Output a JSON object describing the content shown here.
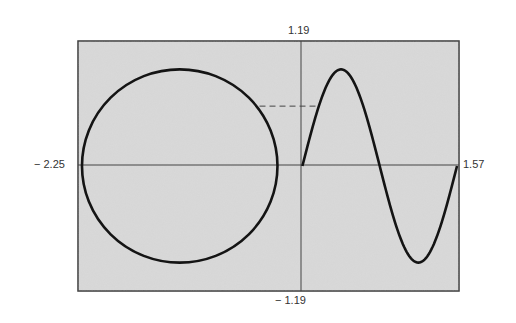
{
  "chart_data": {
    "type": "line",
    "title": "",
    "xlabel": "",
    "ylabel": "",
    "xlim": [
      -2.25,
      1.57
    ],
    "ylim": [
      -1.19,
      1.19
    ],
    "grid": false,
    "legend": null,
    "tick_labels": {
      "x_min": "− 2.25",
      "x_max": "1.57",
      "y_max": "1.19",
      "y_min": "− 1.19"
    },
    "series": [
      {
        "name": "circle",
        "kind": "parametric",
        "description": "closed circle centered left of origin",
        "center": [
          -1.23,
          0.0
        ],
        "radius": 0.98,
        "x_range": [
          -2.21,
          -0.25
        ],
        "y_range": [
          -0.92,
          0.92
        ]
      },
      {
        "name": "sine",
        "kind": "function",
        "description": "one full sine period starting at origin",
        "x": [
          0.0,
          0.1,
          0.2,
          0.3,
          0.39,
          0.5,
          0.6,
          0.7,
          0.77,
          0.9,
          1.0,
          1.1,
          1.16,
          1.3,
          1.4,
          1.5,
          1.55
        ],
        "y": [
          0.0,
          0.36,
          0.66,
          0.86,
          0.92,
          0.84,
          0.62,
          0.31,
          0.0,
          -0.45,
          -0.75,
          -0.9,
          -0.92,
          -0.77,
          -0.5,
          -0.17,
          0.0
        ]
      }
    ],
    "annotations": [
      {
        "type": "dashed-line",
        "description": "horizontal dashed line linking circle to sine curve",
        "y": 0.57,
        "x_from": -0.43,
        "x_to": 0.17
      }
    ]
  },
  "colors": {
    "plot_background": "#d6d6d6",
    "frame": "#3a3a3a",
    "curve": "#141414",
    "axis": "#444444",
    "label": "#333333"
  },
  "labels": {
    "x_min": "− 2.25",
    "x_max": "1.57",
    "y_max": "1.19",
    "y_min": "− 1.19"
  }
}
